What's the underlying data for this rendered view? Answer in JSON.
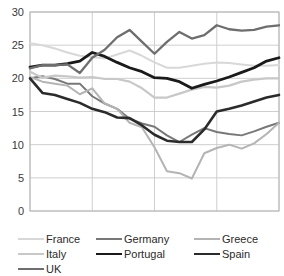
{
  "chart_data": {
    "type": "line",
    "title": "",
    "subtitle": "",
    "xlabel": "",
    "ylabel": "",
    "xlim": [
      1999,
      2019
    ],
    "ylim": [
      0,
      30
    ],
    "grid": true,
    "legend_position": "bottom",
    "y_ticks": [
      "0",
      "5",
      "10",
      "15",
      "20",
      "25",
      "30"
    ],
    "y_tick_values": [
      0,
      5,
      10,
      15,
      20,
      25,
      30
    ],
    "x_ticks": [
      "1999",
      "2004",
      "2009",
      "2014",
      "2019"
    ],
    "x_tick_values": [
      1999,
      2004,
      2009,
      2014,
      2019
    ],
    "x": [
      1999,
      2000,
      2001,
      2002,
      2003,
      2004,
      2005,
      2006,
      2007,
      2008,
      2009,
      2010,
      2011,
      2012,
      2013,
      2014,
      2015,
      2016,
      2017,
      2018,
      2019
    ],
    "series": [
      {
        "name": "France",
        "color": "#d8d8d8",
        "width": 2.0,
        "values": [
          25.3,
          25.0,
          24.5,
          23.9,
          23.4,
          23.2,
          23.0,
          23.6,
          24.2,
          23.4,
          22.4,
          21.6,
          21.6,
          21.9,
          22.2,
          22.4,
          22.3,
          22.1,
          21.9,
          21.9,
          22.0
        ]
      },
      {
        "name": "Germany",
        "color": "#787878",
        "width": 2.0,
        "values": [
          20.0,
          20.3,
          19.9,
          19.2,
          19.2,
          17.3,
          16.2,
          15.4,
          13.9,
          13.2,
          12.7,
          11.4,
          10.4,
          11.5,
          12.5,
          11.9,
          11.6,
          11.4,
          12.0,
          12.7,
          13.3
        ]
      },
      {
        "name": "Greece",
        "color": "#b4b4b4",
        "width": 2.0,
        "values": [
          20.2,
          19.5,
          19.2,
          18.9,
          17.6,
          18.5,
          16.2,
          15.4,
          13.3,
          12.6,
          9.6,
          6.0,
          5.7,
          4.9,
          8.7,
          9.5,
          10.0,
          9.4,
          10.2,
          11.6,
          13.3
        ]
      },
      {
        "name": "Italy",
        "color": "#c8c8c8",
        "width": 2.2,
        "values": [
          21.0,
          20.1,
          20.4,
          20.3,
          20.1,
          20.2,
          19.9,
          19.9,
          19.5,
          18.5,
          17.1,
          17.1,
          17.7,
          18.3,
          18.7,
          18.6,
          18.9,
          19.5,
          19.8,
          20.0,
          20.0
        ]
      },
      {
        "name": "Portugal",
        "color": "#1a1a1a",
        "width": 2.8,
        "values": [
          21.7,
          22.0,
          22.0,
          22.2,
          22.6,
          23.9,
          23.3,
          22.4,
          21.6,
          21.0,
          20.1,
          20.0,
          19.5,
          18.5,
          19.1,
          19.6,
          20.2,
          20.9,
          21.6,
          22.6,
          23.1
        ]
      },
      {
        "name": "Spain",
        "color": "#2b2b2b",
        "width": 2.6,
        "values": [
          20.0,
          17.8,
          17.5,
          16.9,
          16.3,
          15.4,
          14.9,
          14.1,
          14.0,
          12.9,
          11.5,
          10.6,
          10.4,
          10.4,
          12.3,
          15.0,
          15.4,
          15.9,
          16.5,
          17.1,
          17.5
        ]
      },
      {
        "name": "UK",
        "color": "#6e6e6e",
        "width": 2.3,
        "values": [
          21.5,
          22.0,
          22.0,
          22.1,
          20.8,
          23.1,
          24.3,
          26.2,
          27.3,
          25.5,
          23.7,
          25.5,
          27.0,
          26.0,
          26.5,
          28.0,
          27.4,
          27.2,
          27.3,
          27.8,
          28.0
        ]
      }
    ]
  },
  "legend": {
    "rows": [
      [
        {
          "label": "France",
          "series": "France"
        },
        {
          "label": "Germany",
          "series": "Germany"
        },
        {
          "label": "Greece",
          "series": "Greece"
        }
      ],
      [
        {
          "label": "Italy",
          "series": "Italy"
        },
        {
          "label": "Portugal",
          "series": "Portugal"
        },
        {
          "label": "Spain",
          "series": "Spain"
        }
      ],
      [
        {
          "label": "UK",
          "series": "UK"
        }
      ]
    ]
  }
}
